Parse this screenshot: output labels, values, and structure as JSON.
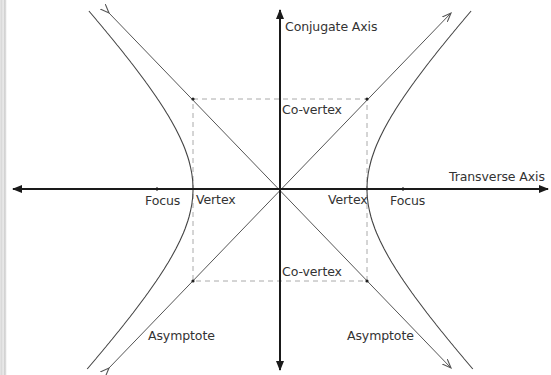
{
  "diagram": {
    "type": "hyperbola",
    "center": [
      280,
      189
    ],
    "a": 87,
    "b": 91,
    "colors": {
      "axis": "#1a1a1a",
      "curve": "#444444",
      "asymptote": "#555555",
      "box": "#aaaaaa",
      "text": "#333333"
    }
  },
  "labels": {
    "conjugate_axis": "Conjugate Axis",
    "transverse_axis": "Transverse Axis",
    "co_vertex_top": "Co-vertex",
    "co_vertex_bottom": "Co-vertex",
    "focus_left": "Focus",
    "focus_right": "Focus",
    "vertex_left": "Vertex",
    "vertex_right": "Vertex",
    "asymptote_left": "Asymptote",
    "asymptote_right": "Asymptote"
  }
}
